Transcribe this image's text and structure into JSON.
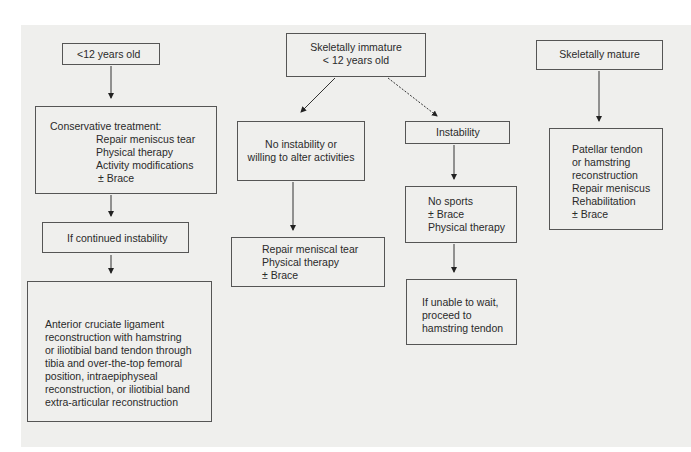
{
  "diagram": {
    "type": "flowchart",
    "nodes": {
      "lt12": {
        "label": "<12 years old"
      },
      "conservative": {
        "title": "Conservative treatment:",
        "items": [
          "Repair meniscus tear",
          "Physical therapy",
          "Activity modifications",
          "± Brace"
        ]
      },
      "continued": {
        "label": "If continued instability"
      },
      "acl": {
        "lines": [
          "Anterior cruciate ligament",
          "reconstruction with hamstring",
          "or iliotibial band tendon through",
          "tibia and over-the-top femoral",
          "position, intraepiphyseal",
          "reconstruction, or iliotibial band",
          "extra-articular reconstruction"
        ]
      },
      "immature": {
        "lines": [
          "Skeletally immature",
          "< 12 years old"
        ]
      },
      "no_instability": {
        "lines": [
          "No instability or",
          "willing to alter activities"
        ]
      },
      "repair_meniscal": {
        "lines": [
          "Repair meniscal tear",
          "Physical therapy",
          "± Brace"
        ]
      },
      "instability": {
        "label": "Instability"
      },
      "no_sports": {
        "lines": [
          "No sports",
          "± Brace",
          "Physical therapy"
        ]
      },
      "unable_wait": {
        "lines": [
          "If unable to wait,",
          "proceed to",
          "hamstring tendon"
        ]
      },
      "mature": {
        "label": "Skeletally mature"
      },
      "mature_tx": {
        "lines": [
          "Patellar tendon",
          "or hamstring",
          "reconstruction",
          "Repair meniscus",
          "Rehabilitation",
          "± Brace"
        ]
      }
    },
    "edges": [
      [
        "lt12",
        "conservative"
      ],
      [
        "conservative",
        "continued"
      ],
      [
        "continued",
        "acl"
      ],
      [
        "immature",
        "no_instability"
      ],
      [
        "immature",
        "instability"
      ],
      [
        "no_instability",
        "repair_meniscal"
      ],
      [
        "instability",
        "no_sports"
      ],
      [
        "no_sports",
        "unable_wait"
      ],
      [
        "mature",
        "mature_tx"
      ]
    ]
  }
}
